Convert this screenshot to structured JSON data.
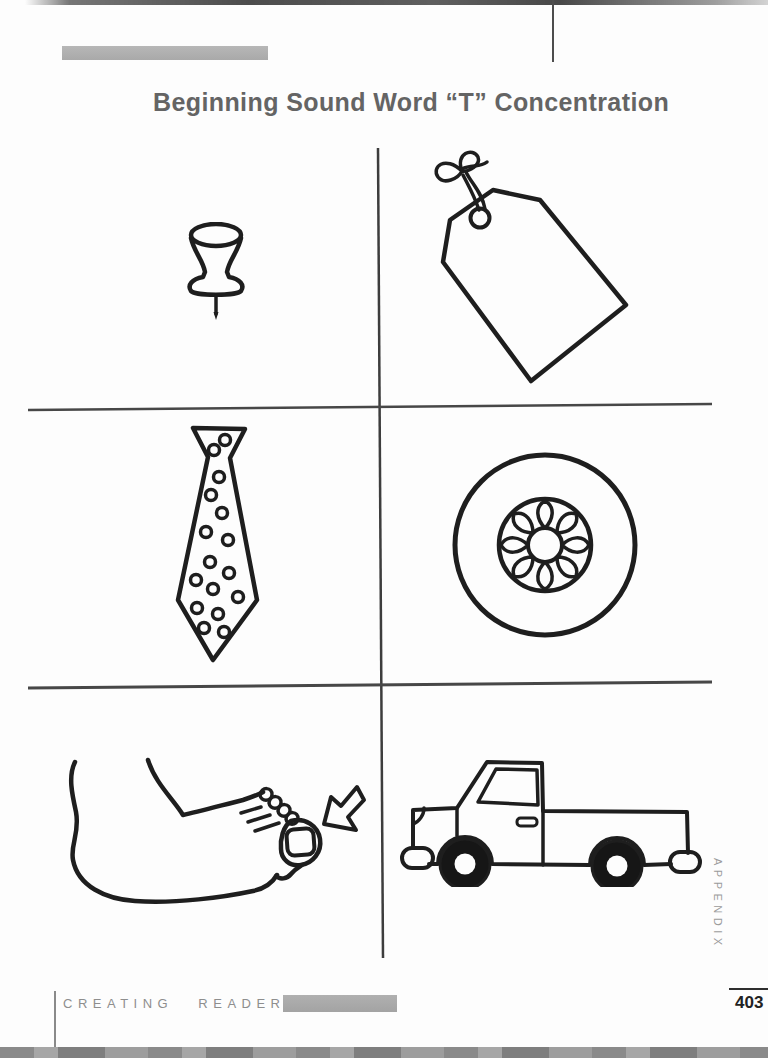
{
  "page": {
    "title": "Beginning Sound Word “T” Concentration",
    "footer": {
      "imprint": "CREATING READERS",
      "page_number": "403"
    },
    "sidebar_label": "APPENDIX",
    "colors": {
      "ink": "#1e1e1e",
      "title": "#646464",
      "bar": "#b2b2b2",
      "footer_text": "#8e8e8e"
    }
  },
  "grid": {
    "rows": 3,
    "columns": 2,
    "beginning_sound": "T"
  },
  "cards": [
    {
      "name": "thumbtack"
    },
    {
      "name": "tag"
    },
    {
      "name": "tie"
    },
    {
      "name": "tire"
    },
    {
      "name": "toe"
    },
    {
      "name": "truck"
    }
  ]
}
